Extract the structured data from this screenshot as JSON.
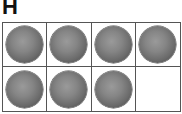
{
  "label": "H",
  "frame": {
    "rows": 2,
    "columns": 4,
    "cells": [
      {
        "filled": true
      },
      {
        "filled": true
      },
      {
        "filled": true
      },
      {
        "filled": true
      },
      {
        "filled": true
      },
      {
        "filled": true
      },
      {
        "filled": true
      },
      {
        "filled": false
      }
    ],
    "filled_count": 7,
    "total_cells": 8,
    "counter_icon": "gray-sphere"
  }
}
